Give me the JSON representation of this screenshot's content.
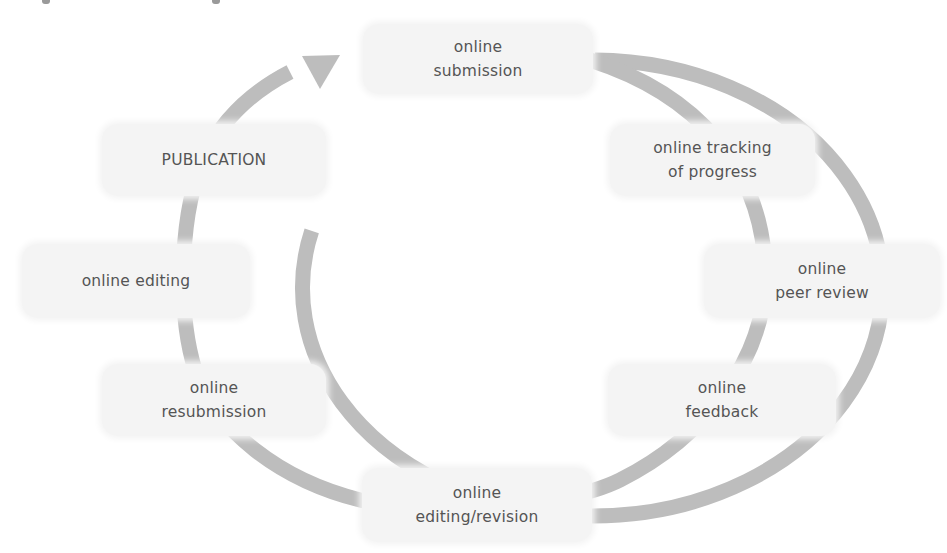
{
  "diagram": {
    "type": "cycle",
    "direction": "clockwise",
    "colors": {
      "arrow": "#bdbdbd",
      "node_fill": "#f4f4f4",
      "text": "#555555",
      "background": "#ffffff"
    },
    "nodes": [
      {
        "id": "submission",
        "label": "online\nsubmission"
      },
      {
        "id": "tracking",
        "label": "online tracking\nof progress"
      },
      {
        "id": "peer-review",
        "label": "online\npeer review"
      },
      {
        "id": "feedback",
        "label": "online\nfeedback"
      },
      {
        "id": "editing-revision",
        "label": "online\nediting/revision"
      },
      {
        "id": "resubmission",
        "label": "online\nresubmission"
      },
      {
        "id": "editing",
        "label": "online editing"
      },
      {
        "id": "publication",
        "label": "PUBLICATION"
      }
    ],
    "arrow_head_at": "submission"
  }
}
